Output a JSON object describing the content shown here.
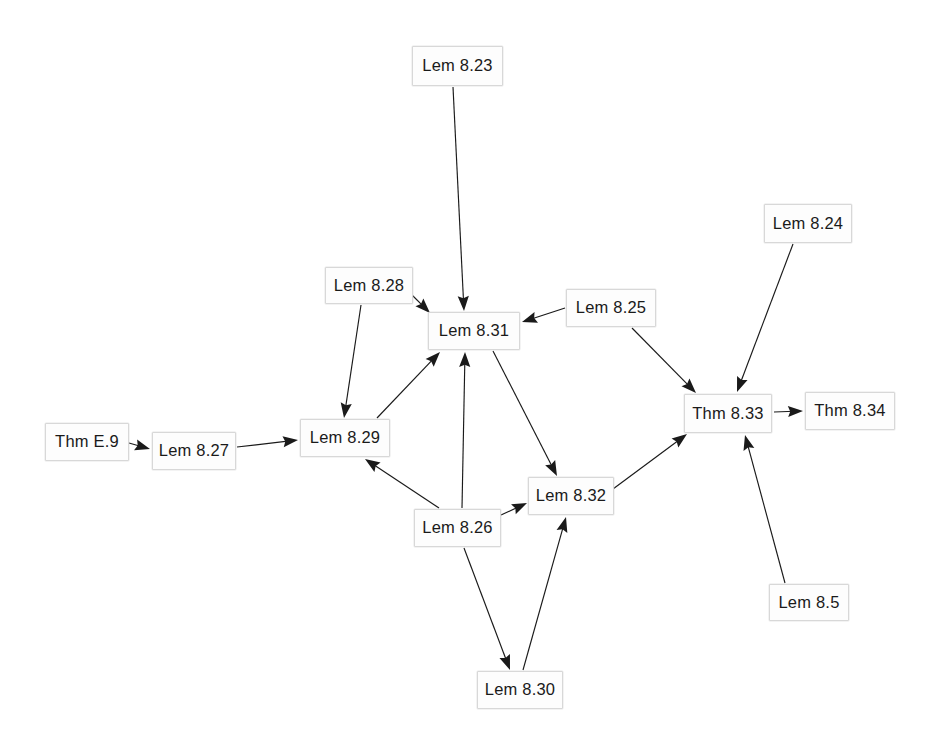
{
  "diagram": {
    "type": "directed-graph",
    "title": "",
    "width": 931,
    "height": 744,
    "background_color": "#ffffff",
    "node_fill_color": "#fdfdfd",
    "node_border_color": "#d8d8d8",
    "edge_color": "#1a1a1a",
    "text_color": "#1a1a1a",
    "nodes": [
      {
        "id": "lem823",
        "label": "Lem 8.23",
        "x": 412,
        "y": 46,
        "w": 91,
        "h": 40
      },
      {
        "id": "lem824",
        "label": "Lem 8.24",
        "x": 764,
        "y": 204,
        "w": 88,
        "h": 39
      },
      {
        "id": "lem828",
        "label": "Lem 8.28",
        "x": 325,
        "y": 267,
        "w": 88,
        "h": 37
      },
      {
        "id": "lem825",
        "label": "Lem 8.25",
        "x": 566,
        "y": 289,
        "w": 90,
        "h": 38
      },
      {
        "id": "lem831",
        "label": "Lem 8.31",
        "x": 428,
        "y": 312,
        "w": 92,
        "h": 38
      },
      {
        "id": "thm833",
        "label": "Thm 8.33",
        "x": 684,
        "y": 394,
        "w": 88,
        "h": 39
      },
      {
        "id": "thme9",
        "label": "Thm E.9",
        "x": 45,
        "y": 423,
        "w": 84,
        "h": 38
      },
      {
        "id": "thm834",
        "label": "Thm 8.34",
        "x": 805,
        "y": 392,
        "w": 90,
        "h": 38
      },
      {
        "id": "lem827",
        "label": "Lem 8.27",
        "x": 152,
        "y": 432,
        "w": 84,
        "h": 38
      },
      {
        "id": "lem829",
        "label": "Lem 8.29",
        "x": 300,
        "y": 419,
        "w": 90,
        "h": 38
      },
      {
        "id": "lem832",
        "label": "Lem 8.32",
        "x": 528,
        "y": 477,
        "w": 86,
        "h": 38
      },
      {
        "id": "lem826",
        "label": "Lem 8.26",
        "x": 414,
        "y": 509,
        "w": 87,
        "h": 38
      },
      {
        "id": "lem85",
        "label": "Lem 8.5",
        "x": 769,
        "y": 584,
        "w": 80,
        "h": 37
      },
      {
        "id": "lem830",
        "label": "Lem 8.30",
        "x": 477,
        "y": 671,
        "w": 86,
        "h": 38
      }
    ],
    "edges": [
      {
        "from": "thme9",
        "to": "lem827",
        "x1": 129,
        "y1": 443,
        "x2": 150,
        "y2": 449
      },
      {
        "from": "lem827",
        "to": "lem829",
        "x1": 237,
        "y1": 447,
        "x2": 298,
        "y2": 440
      },
      {
        "from": "lem823",
        "to": "lem831",
        "x1": 453,
        "y1": 87,
        "x2": 464,
        "y2": 311
      },
      {
        "from": "lem828",
        "to": "lem831",
        "x1": 412,
        "y1": 295,
        "x2": 430,
        "y2": 313
      },
      {
        "from": "lem828",
        "to": "lem829",
        "x1": 361,
        "y1": 305,
        "x2": 344,
        "y2": 418
      },
      {
        "from": "lem829",
        "to": "lem831",
        "x1": 377,
        "y1": 418,
        "x2": 440,
        "y2": 352
      },
      {
        "from": "lem825",
        "to": "lem831",
        "x1": 565,
        "y1": 308,
        "x2": 522,
        "y2": 322
      },
      {
        "from": "lem826",
        "to": "lem829",
        "x1": 439,
        "y1": 508,
        "x2": 365,
        "y2": 459
      },
      {
        "from": "lem826",
        "to": "lem831",
        "x1": 462,
        "y1": 508,
        "x2": 465,
        "y2": 352
      },
      {
        "from": "lem826",
        "to": "lem832",
        "x1": 501,
        "y1": 515,
        "x2": 527,
        "y2": 503
      },
      {
        "from": "lem826",
        "to": "lem830",
        "x1": 464,
        "y1": 548,
        "x2": 510,
        "y2": 670
      },
      {
        "from": "lem831",
        "to": "lem832",
        "x1": 493,
        "y1": 351,
        "x2": 557,
        "y2": 476
      },
      {
        "from": "lem830",
        "to": "lem832",
        "x1": 523,
        "y1": 670,
        "x2": 566,
        "y2": 517
      },
      {
        "from": "lem832",
        "to": "thm833",
        "x1": 613,
        "y1": 489,
        "x2": 687,
        "y2": 434
      },
      {
        "from": "lem824",
        "to": "thm833",
        "x1": 793,
        "y1": 244,
        "x2": 737,
        "y2": 392
      },
      {
        "from": "lem825",
        "to": "thm833",
        "x1": 632,
        "y1": 328,
        "x2": 696,
        "y2": 393
      },
      {
        "from": "lem85",
        "to": "thm833",
        "x1": 785,
        "y1": 583,
        "x2": 745,
        "y2": 435
      },
      {
        "from": "thm833",
        "to": "thm834",
        "x1": 774,
        "y1": 412,
        "x2": 803,
        "y2": 411
      }
    ]
  }
}
